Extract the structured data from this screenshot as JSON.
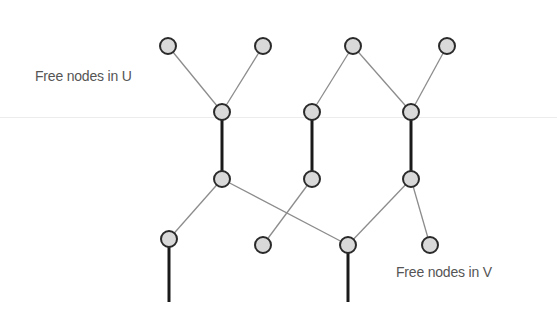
{
  "diagram": {
    "type": "bipartite-matching-graph",
    "colors": {
      "node_fill": "#d9d9d9",
      "node_stroke": "#2a2a2a",
      "thin_edge": "#8c8c8c",
      "matched_edge": "#1a1a1a",
      "label": "#555555"
    },
    "labels": {
      "free_u": "Free nodes in U",
      "free_v": "Free nodes in V"
    },
    "nodes": [
      {
        "id": "u1",
        "x": 168,
        "y": 46
      },
      {
        "id": "u2",
        "x": 263,
        "y": 46
      },
      {
        "id": "u3",
        "x": 353,
        "y": 46
      },
      {
        "id": "u4",
        "x": 447,
        "y": 46
      },
      {
        "id": "v1",
        "x": 222,
        "y": 112
      },
      {
        "id": "v2",
        "x": 312,
        "y": 112
      },
      {
        "id": "v3",
        "x": 411,
        "y": 112
      },
      {
        "id": "u5",
        "x": 222,
        "y": 179
      },
      {
        "id": "u6",
        "x": 312,
        "y": 179
      },
      {
        "id": "u7",
        "x": 411,
        "y": 179
      },
      {
        "id": "v4",
        "x": 169,
        "y": 239
      },
      {
        "id": "v5",
        "x": 263,
        "y": 245
      },
      {
        "id": "v6",
        "x": 348,
        "y": 245
      },
      {
        "id": "v7",
        "x": 430,
        "y": 245
      }
    ],
    "edges": [
      {
        "from": "u1",
        "to": "v1",
        "matched": false
      },
      {
        "from": "u2",
        "to": "v1",
        "matched": false
      },
      {
        "from": "u3",
        "to": "v2",
        "matched": false
      },
      {
        "from": "u3",
        "to": "v3",
        "matched": false
      },
      {
        "from": "u4",
        "to": "v3",
        "matched": false
      },
      {
        "from": "v1",
        "to": "u5",
        "matched": true
      },
      {
        "from": "v2",
        "to": "u6",
        "matched": true
      },
      {
        "from": "v3",
        "to": "u7",
        "matched": true
      },
      {
        "from": "u5",
        "to": "v4",
        "matched": false
      },
      {
        "from": "u5",
        "to": "v6",
        "matched": false
      },
      {
        "from": "u6",
        "to": "v5",
        "matched": false
      },
      {
        "from": "u7",
        "to": "v6",
        "matched": false
      },
      {
        "from": "u7",
        "to": "v7",
        "matched": false
      }
    ],
    "dangling_matched_edges": [
      {
        "from": "v4",
        "x": 169,
        "y1": 239,
        "y2": 302
      },
      {
        "from": "v6",
        "x": 348,
        "y1": 245,
        "y2": 302
      }
    ],
    "node_radius": 8
  }
}
